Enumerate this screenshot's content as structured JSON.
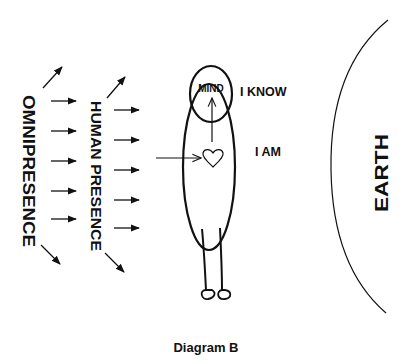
{
  "diagram": {
    "caption": "Diagram B",
    "labels": {
      "omnipresence": "OMNIPRESENCE",
      "human_presence": "HUMAN PRESENCE",
      "mind": "MIND",
      "i_know": "I KNOW",
      "i_am": "I AM",
      "earth": "EARTH"
    },
    "colors": {
      "ink": "#111111",
      "background": "#ffffff"
    },
    "nodes": [
      {
        "id": "omnipresence",
        "label": "OMNIPRESENCE",
        "orientation": "vertical"
      },
      {
        "id": "human_presence",
        "label": "HUMAN PRESENCE",
        "orientation": "vertical"
      },
      {
        "id": "head",
        "label": "MIND",
        "shape": "ellipse"
      },
      {
        "id": "body",
        "shape": "ellipse"
      },
      {
        "id": "heart",
        "shape": "heart"
      },
      {
        "id": "earth",
        "label": "EARTH",
        "shape": "arc"
      }
    ],
    "edges": [
      {
        "from": "omnipresence",
        "to": "human_presence",
        "count": 5,
        "plus_diagonals": 2
      },
      {
        "from": "human_presence",
        "to": "body",
        "count": 5,
        "plus_diagonals": 2
      },
      {
        "from": "outside",
        "to": "heart"
      },
      {
        "from": "heart",
        "to": "head"
      }
    ]
  }
}
